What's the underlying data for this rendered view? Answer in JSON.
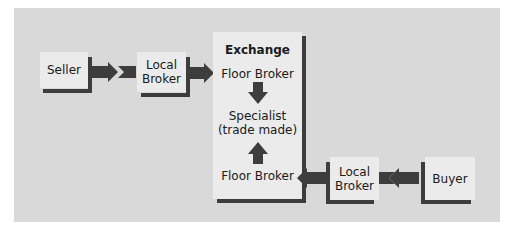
{
  "diagram": {
    "nodes": {
      "seller": "Seller",
      "local_broker_left_line1": "Local",
      "local_broker_left_line2": "Broker",
      "exchange_title": "Exchange",
      "floor_broker_top": "Floor Broker",
      "specialist_line1": "Specialist",
      "specialist_line2": "(trade made)",
      "floor_broker_bottom": "Floor Broker",
      "local_broker_right_line1": "Local",
      "local_broker_right_line2": "Broker",
      "buyer": "Buyer"
    },
    "flows": [
      {
        "from": "Seller",
        "to": "Local Broker"
      },
      {
        "from": "Local Broker",
        "to": "Floor Broker"
      },
      {
        "from": "Floor Broker",
        "to": "Specialist (trade made)"
      },
      {
        "from": "Floor Broker",
        "to": "Specialist (trade made)"
      },
      {
        "from": "Local Broker",
        "to": "Floor Broker"
      },
      {
        "from": "Buyer",
        "to": "Local Broker"
      }
    ],
    "colors": {
      "panel": "#d9d9d9",
      "box": "#ebebeb",
      "arrow": "#3d3d3d",
      "text": "#1a1a1a"
    }
  }
}
